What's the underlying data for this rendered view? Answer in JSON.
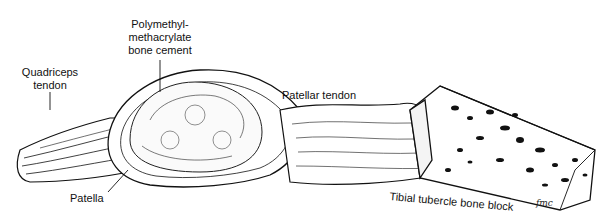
{
  "figure": {
    "type": "anatomical illustration",
    "labels": {
      "cement": [
        "Polymethyl-",
        "methacrylate",
        "bone cement"
      ],
      "quadriceps": [
        "Quadriceps",
        "tendon"
      ],
      "patellar_tendon": "Patellar tendon",
      "patella": "Patella",
      "bone_block": "Tibial tubercle bone block"
    },
    "signature": "fmc"
  }
}
